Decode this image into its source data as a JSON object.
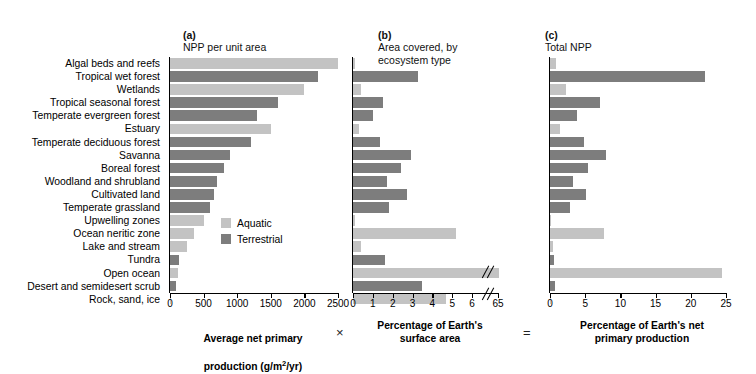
{
  "figure": {
    "panels": [
      {
        "id": "a",
        "tag": "(a)",
        "title": "NPP per unit area"
      },
      {
        "id": "b",
        "tag": "(b)",
        "title": "Area covered, by\necosystem type"
      },
      {
        "id": "c",
        "tag": "(c)",
        "title": "Total NPP"
      }
    ],
    "operators": {
      "multiply": "×",
      "equals": "="
    },
    "captions": {
      "a_line1": "Average net primary",
      "a_line2_pre": "production (g/m",
      "a_line2_sup": "2",
      "a_line2_post": "/yr)",
      "b": "Percentage of Earth's\nsurface area",
      "c": "Percentage of Earth's net\nprimary production"
    },
    "legend": {
      "title": "",
      "items": [
        {
          "label": "Aquatic",
          "color": "#c3c3c3",
          "key": "aquatic"
        },
        {
          "label": "Terrestrial",
          "color": "#7d7d7d",
          "key": "terrestrial"
        }
      ]
    }
  },
  "chart_data": {
    "type": "bar",
    "orientation": "horizontal",
    "grid": false,
    "legend_position": "inside-panel-a-lower-right",
    "group_colors": {
      "aquatic": "#c3c3c3",
      "terrestrial": "#7d7d7d"
    },
    "categories": [
      "Algal beds and reefs",
      "Tropical wet forest",
      "Wetlands",
      "Tropical seasonal forest",
      "Temperate evergreen forest",
      "Estuary",
      "Temperate deciduous forest",
      "Savanna",
      "Boreal forest",
      "Woodland and shrubland",
      "Cultivated land",
      "Temperate grassland",
      "Upwelling zones",
      "Ocean neritic zone",
      "Lake and stream",
      "Tundra",
      "Open ocean",
      "Desert and semidesert scrub",
      "Rock, sand, ice"
    ],
    "groups": [
      "aquatic",
      "terrestrial",
      "aquatic",
      "terrestrial",
      "terrestrial",
      "aquatic",
      "terrestrial",
      "terrestrial",
      "terrestrial",
      "terrestrial",
      "terrestrial",
      "terrestrial",
      "aquatic",
      "aquatic",
      "aquatic",
      "terrestrial",
      "aquatic",
      "terrestrial",
      "aquatic"
    ],
    "panels": [
      {
        "id": "a",
        "label": "(a) NPP per unit area",
        "xlabel": "Average net primary production (g/m2/yr)",
        "xlim": [
          0,
          2500
        ],
        "ticks": [
          0,
          500,
          1000,
          1500,
          2000,
          2500
        ],
        "tick_labels": [
          "0",
          "500",
          "1000",
          "1500",
          "2000",
          "2500"
        ],
        "axis_break": false,
        "values": [
          2500,
          2200,
          2000,
          1600,
          1300,
          1500,
          1200,
          900,
          800,
          700,
          650,
          600,
          500,
          360,
          250,
          140,
          125,
          90,
          3
        ]
      },
      {
        "id": "b",
        "label": "(b) Area covered, by ecosystem type",
        "xlabel": "Percentage of Earth's surface area",
        "xlim": [
          0,
          6.5
        ],
        "ticks": [
          0,
          1,
          2,
          3,
          4,
          5,
          6,
          65
        ],
        "tick_labels": [
          "0",
          "1",
          "2",
          "3",
          "4",
          "5",
          "6",
          "65"
        ],
        "axis_break": true,
        "axis_break_after": 6,
        "values": [
          0.1,
          3.3,
          0.4,
          1.5,
          1.0,
          0.3,
          1.35,
          2.9,
          2.4,
          1.7,
          2.7,
          1.8,
          0.1,
          5.2,
          0.4,
          1.6,
          65.1,
          3.5,
          4.7
        ]
      },
      {
        "id": "c",
        "label": "(c) Total NPP",
        "xlabel": "Percentage of Earth's net primary production",
        "xlim": [
          0,
          25
        ],
        "ticks": [
          0,
          5,
          10,
          15,
          20,
          25
        ],
        "tick_labels": [
          "0",
          "5",
          "10",
          "15",
          "20",
          "25"
        ],
        "axis_break": false,
        "values": [
          0.9,
          22.0,
          2.3,
          7.1,
          3.8,
          1.4,
          4.9,
          7.9,
          5.4,
          3.3,
          5.1,
          2.9,
          0.1,
          7.6,
          0.4,
          0.6,
          24.4,
          0.7,
          0.2
        ]
      }
    ]
  }
}
